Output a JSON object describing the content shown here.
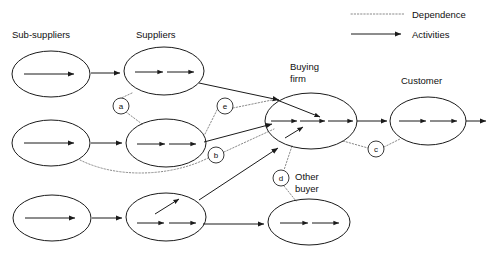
{
  "diagram": {
    "title_labels": {
      "sub_suppliers": "Sub-suppliers",
      "suppliers": "Suppliers",
      "buying_firm_line1": "Buying",
      "buying_firm_line2": "firm",
      "customer": "Customer",
      "other_buyer_line1": "Other",
      "other_buyer_line2": "buyer"
    },
    "legend": {
      "dependence": "Dependence",
      "activities": "Activities"
    },
    "dependence_markers": [
      {
        "id": "a",
        "label": "a",
        "cx": 121,
        "cy": 106,
        "r": 8
      },
      {
        "id": "e",
        "label": "e",
        "cx": 225,
        "cy": 106,
        "r": 8
      },
      {
        "id": "b",
        "label": "b",
        "cx": 216,
        "cy": 155,
        "r": 8
      },
      {
        "id": "c",
        "label": "c",
        "cx": 376,
        "cy": 149,
        "r": 8
      },
      {
        "id": "d",
        "label": "d",
        "cx": 281,
        "cy": 178,
        "r": 8
      }
    ],
    "nodes": [
      {
        "id": "sub-supplier-1",
        "cx": 51,
        "cy": 74,
        "rx": 39,
        "ry": 23,
        "arrows": 1
      },
      {
        "id": "sub-supplier-2",
        "cx": 51,
        "cy": 143,
        "rx": 39,
        "ry": 23,
        "arrows": 1
      },
      {
        "id": "sub-supplier-3",
        "cx": 52,
        "cy": 218,
        "rx": 39,
        "ry": 23,
        "arrows": 1
      },
      {
        "id": "supplier-1",
        "cx": 164,
        "cy": 71,
        "rx": 40,
        "ry": 24,
        "arrows": 2
      },
      {
        "id": "supplier-2",
        "cx": 166,
        "cy": 143,
        "rx": 40,
        "ry": 24,
        "arrows": 2
      },
      {
        "id": "supplier-3",
        "cx": 166,
        "cy": 217,
        "rx": 40,
        "ry": 24,
        "arrows": 2
      },
      {
        "id": "buying-firm",
        "cx": 311,
        "cy": 121,
        "rx": 46,
        "ry": 28,
        "arrows": 3
      },
      {
        "id": "customer",
        "cx": 428,
        "cy": 121,
        "rx": 38,
        "ry": 24,
        "arrows": 2
      },
      {
        "id": "other-buyer",
        "cx": 309,
        "cy": 222,
        "rx": 41,
        "ry": 23,
        "arrows": 2
      }
    ],
    "colors": {
      "stroke": "#1b1b1b",
      "dependence": "#8a8a8a",
      "background": "#ffffff"
    }
  }
}
